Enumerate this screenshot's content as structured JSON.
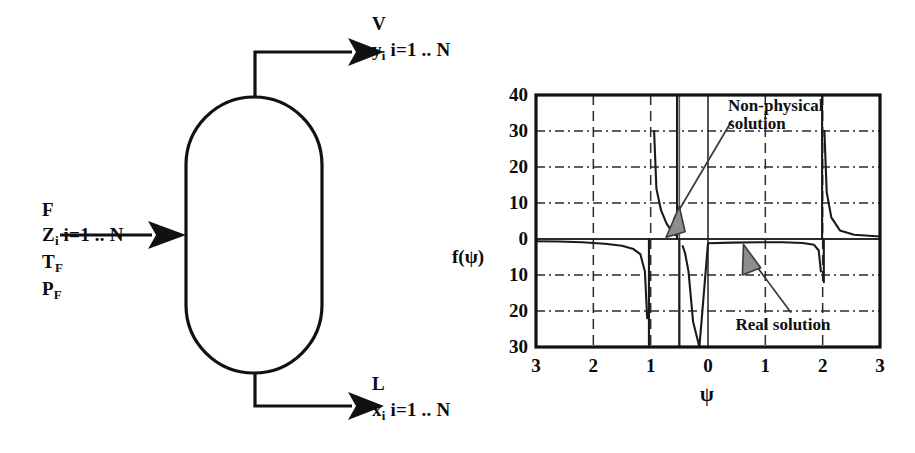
{
  "diagram": {
    "vessel_name": "flash-drum-vessel",
    "feed": {
      "stream_label": "F",
      "composition_label": "Z",
      "composition_subscript": "i",
      "composition_range": " i=1 .. N",
      "temperature_label": "T",
      "temperature_subscript": "F",
      "pressure_label": "P",
      "pressure_subscript": "F"
    },
    "vapor": {
      "stream_label": "V",
      "composition_label": "y",
      "composition_subscript": "i",
      "composition_range": " i=1 .. N"
    },
    "liquid": {
      "stream_label": "L",
      "composition_label": "x",
      "composition_subscript": "i",
      "composition_range": " i=1 .. N"
    }
  },
  "chart_data": {
    "type": "line",
    "title": "",
    "xlabel": "ψ",
    "ylabel": "f(ψ)",
    "xlim": [
      -3,
      3
    ],
    "ylim": [
      -30,
      40
    ],
    "xticks": [
      -3,
      -2,
      -1,
      0,
      1,
      2,
      3
    ],
    "xticklabels": [
      "3",
      "2",
      "1",
      "0",
      "1",
      "2",
      "3"
    ],
    "yticks": [
      40,
      30,
      20,
      10,
      0,
      -10,
      -20,
      -30
    ],
    "yticklabels": [
      "40",
      "30",
      "20",
      "10",
      "0",
      "10",
      "20",
      "30"
    ],
    "grid": true,
    "grid_style": "dashed",
    "legend": "none",
    "asymptotes": [
      -1.0,
      -0.5,
      2.0
    ],
    "series": [
      {
        "name": "f(psi)",
        "description": "Rachford-Rice objective with poles at psi = -1, -0.5 and 2",
        "x": [
          -3.0,
          -2.6,
          -2.2,
          -1.8,
          -1.5,
          -1.3,
          -1.18,
          -1.1,
          -1.06,
          -0.94,
          -0.9,
          -0.82,
          -0.72,
          -0.65,
          -0.6,
          -0.56,
          -0.44,
          -0.4,
          -0.34,
          -0.26,
          -0.15,
          0.0,
          0.4,
          0.9,
          1.3,
          1.65,
          1.85,
          1.93,
          1.97,
          2.03,
          2.07,
          2.15,
          2.3,
          2.55,
          3.0
        ],
        "y": [
          -0.6,
          -0.7,
          -0.9,
          -1.3,
          -1.9,
          -2.8,
          -4.2,
          -9.0,
          -22.0,
          30.0,
          14.0,
          8.0,
          4.2,
          2.6,
          1.7,
          1.0,
          -2.0,
          -4.0,
          -9.0,
          -23.0,
          -31.0,
          -1.2,
          -1.0,
          -0.9,
          -0.9,
          -1.1,
          -1.6,
          -3.2,
          -9.0,
          30.0,
          13.0,
          6.0,
          2.4,
          1.2,
          0.7
        ]
      }
    ],
    "annotations": [
      {
        "name": "non-physical-solution",
        "text_line1": "Non-physical",
        "text_line2": "solution",
        "points_to_x": -0.72,
        "points_to_y": 0.0
      },
      {
        "name": "real-solution",
        "text_line1": "Real solution",
        "text_line2": "",
        "points_to_x": 0.72,
        "points_to_y": 0.0
      }
    ],
    "vertical_marker_lines": [
      {
        "name": "non-physical-marker",
        "x": -0.5,
        "from_y": 40,
        "to_y": -30
      },
      {
        "name": "real-marker",
        "x": 0.5,
        "from_y": 40,
        "to_y": 40
      }
    ]
  }
}
